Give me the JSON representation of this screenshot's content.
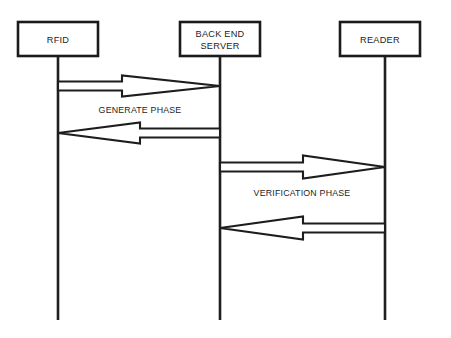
{
  "diagram": {
    "type": "sequence-diagram",
    "background_color": "#ffffff",
    "stroke_color": "#1d1d1d",
    "text_color": "#242424",
    "actors": [
      {
        "id": "rfid",
        "label": "RFID",
        "label_lines": [
          "RFID"
        ],
        "box": {
          "x": 18,
          "y": 22,
          "width": 80,
          "height": 34
        },
        "lifeline_x": 58,
        "lifeline_top": 56,
        "lifeline_bottom": 320
      },
      {
        "id": "back-end-server",
        "label": "BACK END SERVER",
        "label_lines": [
          "BACK END",
          "SERVER"
        ],
        "box": {
          "x": 180,
          "y": 22,
          "width": 80,
          "height": 34
        },
        "lifeline_x": 220,
        "lifeline_top": 56,
        "lifeline_bottom": 320
      },
      {
        "id": "reader",
        "label": "READER",
        "label_lines": [
          "READER"
        ],
        "box": {
          "x": 340,
          "y": 22,
          "width": 80,
          "height": 34
        },
        "lifeline_x": 385,
        "lifeline_top": 56,
        "lifeline_bottom": 320
      }
    ],
    "messages": [
      {
        "id": "msg-1",
        "from": "rfid",
        "to": "back-end-server",
        "direction": "right",
        "phase": "generate",
        "x_start": 58,
        "x_end": 220,
        "y_center": 86
      },
      {
        "id": "msg-2",
        "from": "back-end-server",
        "to": "rfid",
        "direction": "left",
        "phase": "generate",
        "x_start": 220,
        "x_end": 58,
        "y_center": 133
      },
      {
        "id": "msg-3",
        "from": "back-end-server",
        "to": "reader",
        "direction": "right",
        "phase": "verification",
        "x_start": 220,
        "x_end": 385,
        "y_center": 167
      },
      {
        "id": "msg-4",
        "from": "reader",
        "to": "back-end-server",
        "direction": "left",
        "phase": "verification",
        "x_start": 385,
        "x_end": 220,
        "y_center": 228
      }
    ],
    "phase_labels": [
      {
        "id": "generate-phase",
        "text": "GENERATE PHASE",
        "x": 140,
        "y": 113
      },
      {
        "id": "verification-phase",
        "text": "VERIFICATION PHASE",
        "x": 302,
        "y": 196
      }
    ]
  }
}
